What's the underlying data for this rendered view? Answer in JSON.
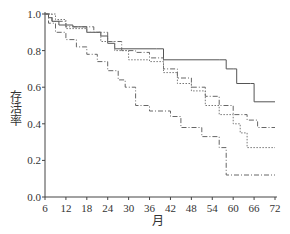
{
  "chart_data": {
    "type": "line",
    "title": "",
    "xlabel": "月",
    "ylabel": "存活率",
    "xlim": [
      6,
      72
    ],
    "ylim": [
      0,
      1.0
    ],
    "x_ticks": [
      6,
      12,
      18,
      24,
      30,
      36,
      42,
      48,
      54,
      60,
      66,
      72
    ],
    "y_ticks": [
      "0.0",
      "0.2",
      "0.4",
      "0.6",
      "0.8",
      "1.0"
    ],
    "grid": false,
    "legend": null,
    "series": [
      {
        "name": "solid",
        "style": "solid",
        "points": [
          [
            6,
            1.0
          ],
          [
            7,
            0.98
          ],
          [
            8,
            0.96
          ],
          [
            10,
            0.94
          ],
          [
            14,
            0.93
          ],
          [
            18,
            0.9
          ],
          [
            22,
            0.88
          ],
          [
            24,
            0.84
          ],
          [
            26,
            0.81
          ],
          [
            38,
            0.81
          ],
          [
            40,
            0.75
          ],
          [
            56,
            0.75
          ],
          [
            58,
            0.7
          ],
          [
            60,
            0.7
          ],
          [
            61,
            0.62
          ],
          [
            65,
            0.62
          ],
          [
            66,
            0.52
          ],
          [
            72,
            0.52
          ]
        ]
      },
      {
        "name": "dash-dot upper",
        "style": "dashdot",
        "points": [
          [
            6,
            1.0
          ],
          [
            8,
            0.96
          ],
          [
            12,
            0.93
          ],
          [
            20,
            0.9
          ],
          [
            24,
            0.85
          ],
          [
            28,
            0.8
          ],
          [
            32,
            0.79
          ],
          [
            36,
            0.76
          ],
          [
            40,
            0.7
          ],
          [
            44,
            0.65
          ],
          [
            48,
            0.6
          ],
          [
            52,
            0.55
          ],
          [
            56,
            0.5
          ],
          [
            60,
            0.45
          ],
          [
            64,
            0.42
          ],
          [
            67,
            0.38
          ],
          [
            72,
            0.38
          ]
        ]
      },
      {
        "name": "dotted",
        "style": "dotted",
        "points": [
          [
            6,
            1.0
          ],
          [
            9,
            0.97
          ],
          [
            12,
            0.92
          ],
          [
            18,
            0.9
          ],
          [
            22,
            0.85
          ],
          [
            26,
            0.8
          ],
          [
            30,
            0.75
          ],
          [
            36,
            0.74
          ],
          [
            40,
            0.68
          ],
          [
            44,
            0.62
          ],
          [
            48,
            0.58
          ],
          [
            52,
            0.5
          ],
          [
            56,
            0.45
          ],
          [
            60,
            0.4
          ],
          [
            62,
            0.35
          ],
          [
            64,
            0.27
          ],
          [
            72,
            0.27
          ]
        ]
      },
      {
        "name": "dash-dot lower",
        "style": "dashdot",
        "points": [
          [
            6,
            1.0
          ],
          [
            7,
            0.95
          ],
          [
            9,
            0.9
          ],
          [
            12,
            0.86
          ],
          [
            15,
            0.82
          ],
          [
            18,
            0.78
          ],
          [
            21,
            0.74
          ],
          [
            24,
            0.69
          ],
          [
            27,
            0.64
          ],
          [
            29,
            0.6
          ],
          [
            32,
            0.5
          ],
          [
            36,
            0.47
          ],
          [
            42,
            0.44
          ],
          [
            45,
            0.38
          ],
          [
            51,
            0.33
          ],
          [
            56,
            0.27
          ],
          [
            58,
            0.12
          ],
          [
            72,
            0.12
          ]
        ]
      }
    ]
  }
}
